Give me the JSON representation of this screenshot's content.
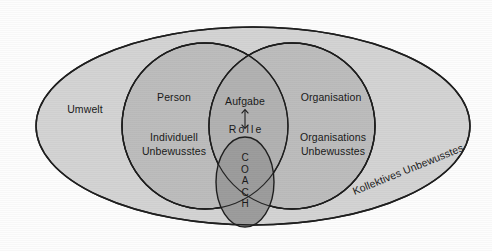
{
  "diagram": {
    "labels": {
      "umwelt": "Umwelt",
      "person": "Person",
      "individuell_unbewusstes": "Individuell\nUnbewusstes",
      "organisation": "Organisation",
      "organisations_unbewusstes": "Organisations\nUnbewusstes",
      "aufgabe": "Aufgabe",
      "rolle": "Rolle",
      "coach": "C\nO\nA\nC\nH",
      "kollektives_unbewusstes": "Kollektives Unbewusstes"
    },
    "colors": {
      "background": "#fdfdfd",
      "outer_ellipse_fill": "#d2d2d2",
      "circle_fill": "#bcbcbc",
      "lens_fill": "#b0b0b0",
      "coach_fill": "#9a9a9a",
      "stroke": "#1f1f1f",
      "text": "#1a1a1a"
    },
    "shapes": [
      {
        "name": "outer-ellipse",
        "label": "Kollektives Unbewusstes",
        "cx": 253,
        "cy": 126,
        "rx": 217,
        "ry": 99
      },
      {
        "name": "person-circle",
        "label": "Person / Individuell Unbewusstes",
        "cx": 205,
        "cy": 126,
        "rx": 83,
        "ry": 83
      },
      {
        "name": "organisation-circle",
        "label": "Organisation / Organisations Unbewusstes",
        "cx": 292,
        "cy": 126,
        "rx": 83,
        "ry": 83
      },
      {
        "name": "coach-ellipse",
        "label": "COACH",
        "cx": 245,
        "cy": 182,
        "rx": 29,
        "ry": 45
      }
    ],
    "arrow": {
      "name": "aufgabe-rolle-arrow",
      "direction": "double-vertical",
      "x": 245,
      "y1": 110,
      "y2": 128
    }
  }
}
